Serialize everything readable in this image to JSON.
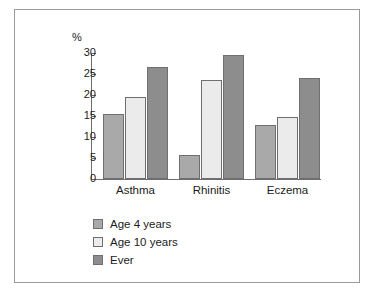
{
  "chart_data": {
    "type": "bar",
    "title": "",
    "subtitle": "",
    "xlabel": "",
    "ylabel": "%",
    "ylim": [
      0,
      30
    ],
    "ytick_values": [
      30,
      25,
      20,
      15,
      10,
      5,
      0
    ],
    "ytick_labels": [
      "30",
      "25",
      "20",
      "15",
      "10",
      "5",
      "0"
    ],
    "grid": false,
    "legend_position": "below-left",
    "categories": [
      "Asthma",
      "Rhinitis",
      "Eczema"
    ],
    "series": [
      {
        "name": "Age 4 years",
        "color": "#a9a9a9",
        "values": [
          15.5,
          5.7,
          12.9
        ]
      },
      {
        "name": "Age 10 years",
        "color": "#ebebeb",
        "values": [
          19.5,
          23.6,
          14.8
        ]
      },
      {
        "name": "Ever",
        "color": "#8d8d8d",
        "values": [
          26.7,
          29.5,
          24.0
        ]
      }
    ],
    "annotations": []
  },
  "figure": {
    "border_color": "#9a9a9a",
    "background": "#ffffff",
    "axis_color": "#6e6e6e",
    "bar_outline_color": "#6f6f6f"
  }
}
